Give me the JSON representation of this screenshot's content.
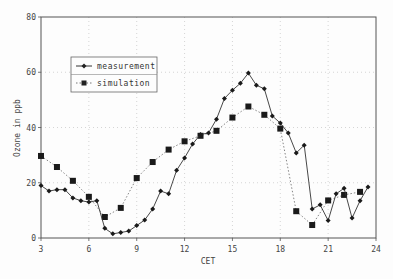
{
  "chart_data": {
    "type": "line",
    "title": "",
    "xlabel": "CET",
    "ylabel": "Ozone in ppb",
    "xlim": [
      3,
      24
    ],
    "ylim": [
      0,
      80
    ],
    "xticks": [
      3,
      6,
      9,
      12,
      15,
      18,
      21,
      24
    ],
    "yticks": [
      0,
      20,
      40,
      60,
      80
    ],
    "grid": true,
    "legend_position": "upper left (inside)",
    "series": [
      {
        "name": "measurement",
        "marker": "diamond",
        "line": "solid",
        "x": [
          3,
          3.5,
          4,
          4.5,
          5,
          5.5,
          6,
          6.5,
          7,
          7.5,
          8,
          8.5,
          9,
          9.5,
          10,
          10.5,
          11,
          11.5,
          12,
          12.5,
          13,
          13.5,
          14,
          14.5,
          15,
          15.5,
          16,
          16.5,
          17,
          17.5,
          18,
          18.5,
          19,
          19.5,
          20,
          20.5,
          21,
          21.5,
          22,
          22.5,
          23,
          23.5
        ],
        "values": [
          19,
          17,
          17.5,
          17.5,
          14.5,
          13.5,
          13,
          13.5,
          3.5,
          1.5,
          2,
          2.5,
          4.5,
          6.5,
          10.5,
          17,
          16,
          24.5,
          29,
          34,
          37.5,
          38,
          43,
          50.5,
          53.5,
          56,
          59.7,
          55.3,
          54,
          44.2,
          41.6,
          38,
          30.8,
          33.6,
          10.5,
          12,
          6.3,
          16,
          18,
          7.2,
          13.5,
          18.5
        ]
      },
      {
        "name": "simulation",
        "marker": "square",
        "line": "dotted",
        "x": [
          3,
          4,
          5,
          6,
          7,
          8,
          9,
          10,
          11,
          12,
          13,
          14,
          15,
          16,
          17,
          18,
          19,
          20,
          21,
          22,
          23
        ],
        "values": [
          29.7,
          25.7,
          20.7,
          14.9,
          7.6,
          10.9,
          21.7,
          27.5,
          32,
          35,
          37,
          38.8,
          43.6,
          47.6,
          44.6,
          39.6,
          9.7,
          4.7,
          13.6,
          15.6,
          16.7
        ]
      }
    ]
  },
  "labels": {
    "xlabel": "CET",
    "ylabel": "Ozone in ppb",
    "legend_measurement": "measurement",
    "legend_simulation": "simulation",
    "xticks": [
      "3",
      "6",
      "9",
      "12",
      "15",
      "18",
      "21",
      "24"
    ],
    "yticks": [
      "0",
      "20",
      "40",
      "60",
      "80"
    ]
  }
}
